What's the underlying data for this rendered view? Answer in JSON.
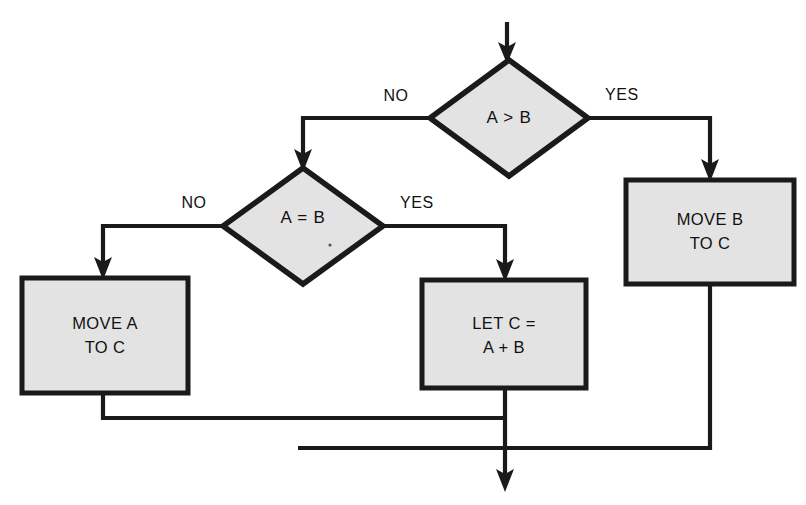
{
  "diagram": {
    "type": "flowchart",
    "title": "",
    "background_color": "#ffffff",
    "shape_fill_color": "#e3e3e3",
    "line_color": "#1a1a1a",
    "decisions": [
      {
        "id": "decision-a-greater-b",
        "text": "A > B",
        "center_x": 509,
        "center_y": 118,
        "width": 158,
        "height": 116,
        "branches": {
          "no_label": "NO",
          "yes_label": "YES"
        }
      },
      {
        "id": "decision-a-equals-b",
        "text": "A = B",
        "center_x": 303,
        "center_y": 226,
        "width": 160,
        "height": 115,
        "branches": {
          "no_label": "NO",
          "yes_label": "YES"
        }
      }
    ],
    "processes": [
      {
        "id": "process-move-a-to-c",
        "line1": "MOVE A",
        "line2": "TO C",
        "x": 22,
        "y": 278,
        "width": 166,
        "height": 115
      },
      {
        "id": "process-let-c-equals-a-plus-b",
        "line1": "LET C =",
        "line2": "A + B",
        "x": 422,
        "y": 280,
        "width": 164,
        "height": 108
      },
      {
        "id": "process-move-b-to-c",
        "line1": "MOVE B",
        "line2": "TO C",
        "x": 626,
        "y": 180,
        "width": 168,
        "height": 104
      }
    ],
    "edge_labels": {
      "d1_no": "NO",
      "d1_yes": "YES",
      "d2_no": "NO",
      "d2_yes": "YES"
    },
    "connectors": [
      {
        "id": "entry-arrow-to-decision-1",
        "from": "entry",
        "to": "decision-a-greater-b"
      },
      {
        "id": "decision-1-no-to-decision-2",
        "from": "decision-a-greater-b",
        "to": "decision-a-equals-b",
        "label": "NO"
      },
      {
        "id": "decision-1-yes-to-move-b",
        "from": "decision-a-greater-b",
        "to": "process-move-b-to-c",
        "label": "YES"
      },
      {
        "id": "decision-2-no-to-move-a",
        "from": "decision-a-equals-b",
        "to": "process-move-a-to-c",
        "label": "NO"
      },
      {
        "id": "decision-2-yes-to-let-c",
        "from": "decision-a-equals-b",
        "to": "process-let-c-equals-a-plus-b",
        "label": "YES"
      },
      {
        "id": "move-a-merge-line",
        "from": "process-move-a-to-c",
        "to": "merge"
      },
      {
        "id": "let-c-merge-line",
        "from": "process-let-c-equals-a-plus-b",
        "to": "merge"
      },
      {
        "id": "move-b-merge-line",
        "from": "process-move-b-to-c",
        "to": "merge"
      },
      {
        "id": "exit-arrow",
        "from": "merge",
        "to": "exit"
      }
    ]
  }
}
